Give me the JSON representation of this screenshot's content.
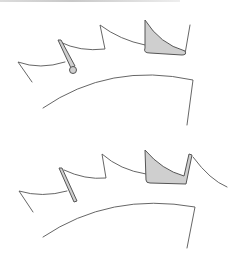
{
  "figure": {
    "panels": [
      {
        "name": "top",
        "pawl": "needle with ball end",
        "shaded_tooth": "curved triangular tooth"
      },
      {
        "name": "bottom",
        "pawl": "straight bar",
        "shaded_tooth": "tooth with hooked tip"
      }
    ],
    "colors": {
      "line": "#555555",
      "shade": "#cfcfcf",
      "background": "#ffffff"
    }
  }
}
